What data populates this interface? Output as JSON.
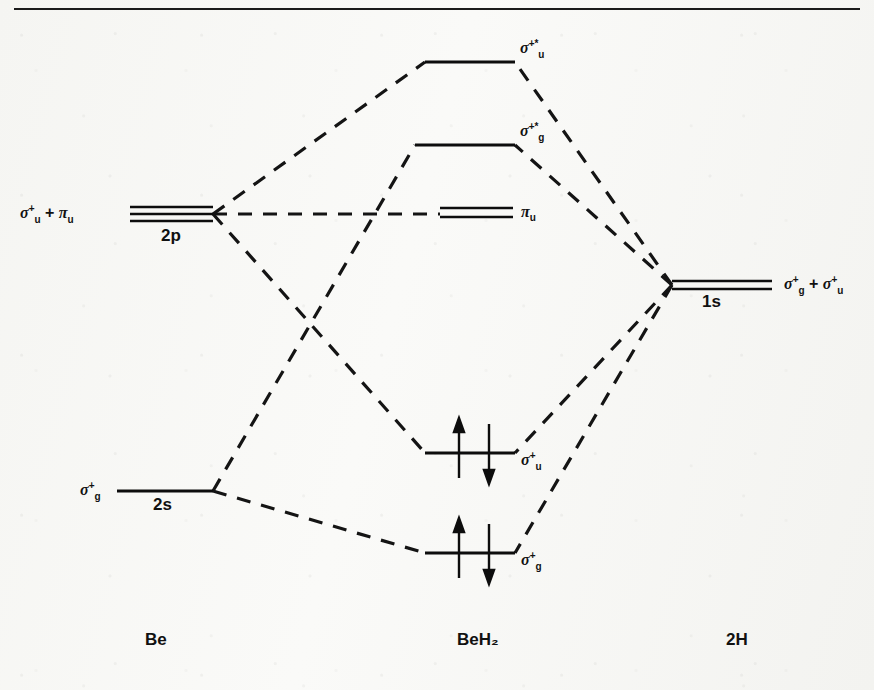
{
  "figure": {
    "title_rule": true,
    "background_color": "#f7f7f5",
    "ink_color": "#111111"
  },
  "columns": [
    {
      "id": "be",
      "label": "Be",
      "x": 145
    },
    {
      "id": "beh2",
      "label": "BeH₂",
      "x": 487
    },
    {
      "id": "h2",
      "label": "2H",
      "x": 737
    }
  ],
  "atomic_levels_left": [
    {
      "id": "2p",
      "shell": "2p",
      "symmetry_sigma": "σ",
      "symmetry_sup": "+",
      "symmetry_sub": "u",
      "symmetry_extra": " + ",
      "symmetry2": "π",
      "symmetry2_sub": "u",
      "label_text": "σu+ + πu",
      "degeneracy": 3,
      "x1": 130,
      "x2": 213,
      "y": 214
    },
    {
      "id": "2s",
      "shell": "2s",
      "symmetry_sigma": "σ",
      "symmetry_sup": "+",
      "symmetry_sub": "g",
      "label_text": "σg+",
      "degeneracy": 1,
      "x1": 117,
      "x2": 213,
      "y": 491
    }
  ],
  "atomic_levels_right": [
    {
      "id": "1s",
      "shell": "1s",
      "label_text": "σg+ + σu+",
      "degeneracy": 2,
      "x1": 672,
      "x2": 772,
      "y": 285
    }
  ],
  "molecular_levels": [
    {
      "id": "sigma-u-star",
      "label_text": "σu+*",
      "sigma": "σ",
      "sup": "+*",
      "sub": "u",
      "degeneracy": 1,
      "occupancy": 0,
      "x1": 425,
      "x2": 515,
      "y": 62
    },
    {
      "id": "sigma-g-star",
      "label_text": "σg+*",
      "sigma": "σ",
      "sup": "+*",
      "sub": "g",
      "degeneracy": 1,
      "occupancy": 0,
      "x1": 415,
      "x2": 515,
      "y": 145
    },
    {
      "id": "pi-u",
      "label_text": "πu",
      "sigma": "π",
      "sup": "",
      "sub": "u",
      "degeneracy": 2,
      "occupancy": 0,
      "x1": 440,
      "x2": 513,
      "y": 214
    },
    {
      "id": "sigma-u-bonding",
      "label_text": "σu+",
      "sigma": "σ",
      "sup": "+",
      "sub": "u",
      "degeneracy": 1,
      "occupancy": 2,
      "x1": 425,
      "x2": 515,
      "y": 453
    },
    {
      "id": "sigma-g-bonding",
      "label_text": "σg+",
      "sigma": "σ",
      "sup": "+",
      "sub": "g",
      "degeneracy": 1,
      "occupancy": 2,
      "x1": 425,
      "x2": 515,
      "y": 553
    }
  ],
  "electron_pairs": [
    {
      "level": "sigma-u-bonding",
      "up_x": 459,
      "down_x": 489,
      "y": 453,
      "up_arrow": "↑",
      "down_arrow": "↓"
    },
    {
      "level": "sigma-g-bonding",
      "up_x": 459,
      "down_x": 489,
      "y": 553,
      "up_arrow": "↑",
      "down_arrow": "↓"
    }
  ],
  "correlation_lines": [
    {
      "from": "2p",
      "to": "sigma-u-star",
      "x1": 213,
      "y1": 214,
      "x2": 425,
      "y2": 62
    },
    {
      "from": "2p",
      "to": "pi-u",
      "x1": 213,
      "y1": 214,
      "x2": 440,
      "y2": 214
    },
    {
      "from": "2p",
      "to": "sigma-u-bonding",
      "x1": 213,
      "y1": 214,
      "x2": 425,
      "y2": 453
    },
    {
      "from": "2s",
      "to": "sigma-g-star",
      "x1": 213,
      "y1": 491,
      "x2": 415,
      "y2": 145
    },
    {
      "from": "2s",
      "to": "sigma-g-bonding",
      "x1": 213,
      "y1": 491,
      "x2": 425,
      "y2": 553
    },
    {
      "from": "1s",
      "to": "sigma-u-star",
      "x1": 672,
      "y1": 285,
      "x2": 515,
      "y2": 62
    },
    {
      "from": "1s",
      "to": "sigma-g-star",
      "x1": 672,
      "y1": 285,
      "x2": 515,
      "y2": 145
    },
    {
      "from": "1s",
      "to": "sigma-u-bonding",
      "x1": 672,
      "y1": 285,
      "x2": 515,
      "y2": 453
    },
    {
      "from": "1s",
      "to": "sigma-g-bonding",
      "x1": 672,
      "y1": 285,
      "x2": 515,
      "y2": 553
    }
  ],
  "shell_labels": [
    {
      "id": "2p-shell",
      "text": "2p",
      "x": 161,
      "y": 224
    },
    {
      "id": "2s-shell",
      "text": "2s",
      "x": 153,
      "y": 499
    },
    {
      "id": "1s-shell",
      "text": "1s",
      "x": 702,
      "y": 293
    }
  ],
  "orbital_labels": {
    "left_2p": {
      "sigma": "σ",
      "sup": "+",
      "sub": "u",
      "join": " + ",
      "pi": "π",
      "pi_sub": "u"
    },
    "left_2s": {
      "sigma": "σ",
      "sup": "+",
      "sub": "g"
    },
    "right_1s": {
      "sigma1": "σ",
      "sup1": "+",
      "sub1": "g",
      "join": " + ",
      "sigma2": "σ",
      "sup2": "+",
      "sub2": "u"
    },
    "mo_sigma_u_star": {
      "sigma": "σ",
      "sup": "+*",
      "sub": "u"
    },
    "mo_sigma_g_star": {
      "sigma": "σ",
      "sup": "+*",
      "sub": "g"
    },
    "mo_pi_u": {
      "sigma": "π",
      "sup": "",
      "sub": "u"
    },
    "mo_sigma_u": {
      "sigma": "σ",
      "sup": "+",
      "sub": "u"
    },
    "mo_sigma_g": {
      "sigma": "σ",
      "sup": "+",
      "sub": "g"
    }
  }
}
